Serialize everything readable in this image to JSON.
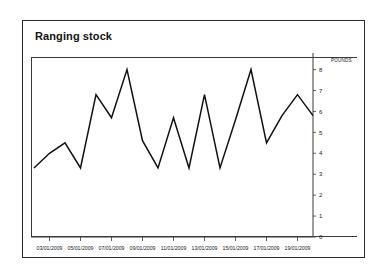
{
  "card": {
    "title": "Ranging stock"
  },
  "chart_data": {
    "type": "line",
    "title": "Ranging stock",
    "xlabel": "",
    "ylabel": "POUNDS",
    "unit_label": "POUNDS",
    "ylim": [
      0,
      8.6
    ],
    "yticks": [
      0,
      1,
      2,
      3,
      4,
      5,
      6,
      7,
      8
    ],
    "ytick_labels": [
      "0",
      "1",
      "2",
      "3",
      "4",
      "5",
      "6",
      "7",
      "8"
    ],
    "y_axis_position": "right",
    "grid": false,
    "legend": false,
    "x": [
      "02/01/2009",
      "03/01/2009",
      "04/01/2009",
      "05/01/2009",
      "06/01/2009",
      "07/01/2009",
      "08/01/2009",
      "09/01/2009",
      "10/01/2009",
      "11/01/2009",
      "12/01/2009",
      "13/01/2009",
      "14/01/2009",
      "15/01/2009",
      "16/01/2009",
      "17/01/2009",
      "18/01/2009",
      "19/01/2009",
      "20/01/2009"
    ],
    "xtick_labels": [
      "03/01/2009",
      "05/01/2009",
      "07/01/2009",
      "09/01/2009",
      "11/01/2009",
      "13/01/2009",
      "15/01/2009",
      "17/01/2009",
      "19/01/2009"
    ],
    "xtick_indices": [
      1,
      3,
      5,
      7,
      9,
      11,
      13,
      15,
      17
    ],
    "values": [
      3.3,
      4.0,
      4.5,
      3.3,
      6.8,
      5.7,
      8.0,
      4.6,
      3.3,
      5.7,
      3.3,
      6.8,
      3.3,
      5.6,
      8.0,
      4.5,
      5.8,
      6.8,
      5.8
    ],
    "series": [
      {
        "name": "Ranging stock",
        "color": "#111111",
        "values": [
          3.3,
          4.0,
          4.5,
          3.3,
          6.8,
          5.7,
          8.0,
          4.6,
          3.3,
          5.7,
          3.3,
          6.8,
          3.3,
          5.6,
          8.0,
          4.5,
          5.8,
          6.8,
          5.8
        ]
      }
    ]
  },
  "colors": {
    "line": "#111111",
    "axis": "#3a3a3a",
    "border": "#2b2b2b",
    "text": "#141414",
    "background": "#ffffff"
  }
}
